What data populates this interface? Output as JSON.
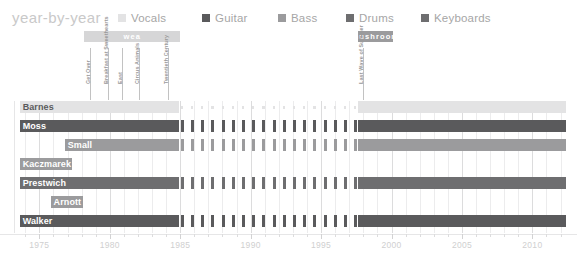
{
  "header": {
    "title": "year-by-year"
  },
  "legend": {
    "items": [
      {
        "label": "Vocals",
        "color": "#e3e3e4",
        "x": 0
      },
      {
        "label": "Guitar",
        "color": "#5a5a5c",
        "x": 84
      },
      {
        "label": "Bass",
        "color": "#9b9b9d",
        "x": 160
      },
      {
        "label": "Drums",
        "color": "#6e6e70",
        "x": 228
      },
      {
        "label": "Keyboards",
        "color": "#6e6e70",
        "x": 303
      }
    ]
  },
  "eras": [
    {
      "label": "wea",
      "start": 1978.2,
      "end": 1985.0,
      "color": "#d6d6d7"
    },
    {
      "label": "mushroom",
      "start": 1997.6,
      "end": 2000.1,
      "color": "#9b9b9d"
    }
  ],
  "annotations": [
    {
      "label": "Get Over",
      "year": 1978.6,
      "height": 36
    },
    {
      "label": "Breakfast at Sweethearts",
      "year": 1979.9,
      "height": 36
    },
    {
      "label": "East",
      "year": 1980.9,
      "height": 36
    },
    {
      "label": "Circus Animals",
      "year": 1982.1,
      "height": 36
    },
    {
      "label": "Twentieth Century",
      "year": 1984.1,
      "height": 36
    },
    {
      "label": "Last Wave of Summer",
      "year": 1998.0,
      "height": 36
    }
  ],
  "chart_data": {
    "type": "table",
    "title": "year-by-year",
    "xlabel": "",
    "ylabel": "",
    "xlim": [
      1973.2,
      2012.6
    ],
    "grid": true,
    "legend_position": "top",
    "tick_labels": [
      "1975",
      "1980",
      "1985",
      "1990",
      "1995",
      "2000",
      "2005",
      "2010"
    ],
    "tick_values": [
      1975,
      1980,
      1985,
      1990,
      1995,
      2000,
      2005,
      2010
    ],
    "minor_tick_step": 1,
    "members": [
      {
        "name": "Barnes",
        "instrument": "Vocals",
        "color": "#e3e3e4",
        "label_color": "#5a5a5c",
        "segments": [
          {
            "start": 1973.6,
            "end": 1984.9,
            "style": "solid"
          },
          {
            "start": 1984.9,
            "end": 1997.6,
            "style": "dotted"
          },
          {
            "start": 1997.6,
            "end": 2012.4,
            "style": "solid"
          }
        ]
      },
      {
        "name": "Moss",
        "instrument": "Guitar",
        "color": "#5a5a5c",
        "label_color": "#ffffff",
        "segments": [
          {
            "start": 1973.6,
            "end": 1984.9,
            "style": "solid"
          },
          {
            "start": 1984.9,
            "end": 1997.6,
            "style": "dashed"
          },
          {
            "start": 1997.6,
            "end": 2012.4,
            "style": "solid"
          }
        ]
      },
      {
        "name": "Small",
        "instrument": "Bass",
        "color": "#9b9b9d",
        "label_color": "#ffffff",
        "segments": [
          {
            "start": 1976.8,
            "end": 1984.9,
            "style": "solid"
          },
          {
            "start": 1984.9,
            "end": 1997.6,
            "style": "dashed"
          },
          {
            "start": 1997.6,
            "end": 2012.4,
            "style": "solid"
          }
        ]
      },
      {
        "name": "Kaczmarek",
        "instrument": "Bass",
        "color": "#9b9b9d",
        "label_color": "#ffffff",
        "segments": [
          {
            "start": 1973.6,
            "end": 1977.3,
            "style": "solid"
          }
        ]
      },
      {
        "name": "Prestwich",
        "instrument": "Drums",
        "color": "#6e6e70",
        "label_color": "#ffffff",
        "segments": [
          {
            "start": 1973.6,
            "end": 1984.9,
            "style": "solid"
          },
          {
            "start": 1984.9,
            "end": 1997.6,
            "style": "dashed"
          },
          {
            "start": 1997.6,
            "end": 2012.4,
            "style": "solid"
          }
        ]
      },
      {
        "name": "Arnott",
        "instrument": "Keyboards",
        "color": "#9b9b9d",
        "label_color": "#ffffff",
        "segments": [
          {
            "start": 1975.8,
            "end": 1978.1,
            "style": "solid"
          }
        ]
      },
      {
        "name": "Walker",
        "instrument": "Keyboards",
        "color": "#5a5a5c",
        "label_color": "#ffffff",
        "segments": [
          {
            "start": 1973.6,
            "end": 1984.9,
            "style": "solid"
          },
          {
            "start": 1984.9,
            "end": 1997.6,
            "style": "dashed"
          },
          {
            "start": 1997.6,
            "end": 2012.4,
            "style": "solid"
          }
        ]
      }
    ]
  }
}
